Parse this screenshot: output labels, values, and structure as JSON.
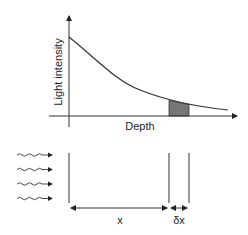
{
  "diagram": {
    "graph": {
      "y_axis_label": "Light intensity",
      "x_axis_label": "Depth",
      "curve": "exponential-decay",
      "shaded_slice_color": "#777777"
    },
    "layer": {
      "incoming_light": "wavy-arrows",
      "wave_count": 4,
      "x_label": "x",
      "dx_label": "δx"
    },
    "colors": {
      "line": "#333333",
      "fill": "#777777"
    }
  }
}
